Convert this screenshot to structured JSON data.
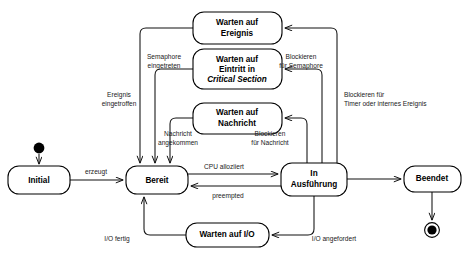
{
  "diagram": {
    "type": "uml-state-diagram",
    "language": "de",
    "colors": {
      "background": "#ffffff",
      "stroke": "#000000",
      "label": "#1a1a1a"
    },
    "states": [
      {
        "id": "initial",
        "lines": [
          "Initial"
        ],
        "x": 8,
        "y": 166,
        "w": 62,
        "h": 28
      },
      {
        "id": "bereit",
        "lines": [
          "Bereit"
        ],
        "x": 126,
        "y": 166,
        "w": 62,
        "h": 28
      },
      {
        "id": "in-ausfuehrung",
        "lines": [
          "In",
          "Ausführung"
        ],
        "x": 281,
        "y": 163,
        "w": 66,
        "h": 33
      },
      {
        "id": "beendet",
        "lines": [
          "Beendet"
        ],
        "x": 404,
        "y": 166,
        "w": 57,
        "h": 26
      },
      {
        "id": "warten-auf-ereignis",
        "lines": [
          "Warten auf",
          "Ereignis"
        ],
        "x": 193,
        "y": 12,
        "w": 89,
        "h": 32
      },
      {
        "id": "warten-auf-eintritt-critical-section",
        "lines": [
          "Warten auf",
          "Eintritt in",
          "Critical Section"
        ],
        "italic_lines": [
          2
        ],
        "x": 193,
        "y": 49,
        "w": 89,
        "h": 40
      },
      {
        "id": "warten-auf-nachricht",
        "lines": [
          "Warten auf",
          "Nachricht"
        ],
        "x": 193,
        "y": 103,
        "w": 89,
        "h": 31
      },
      {
        "id": "warten-auf-io",
        "lines": [
          "Warten auf I/O"
        ],
        "x": 186,
        "y": 223,
        "w": 83,
        "h": 24
      }
    ],
    "pseudostates": [
      {
        "id": "start-node",
        "kind": "initial-pseudostate",
        "cx": 39,
        "cy": 148,
        "r": 5.4
      },
      {
        "id": "final-node",
        "kind": "final-pseudostate",
        "cx": 432,
        "cy": 230,
        "r_outer": 7.4,
        "r_inner": 4.6
      }
    ],
    "transitions": [
      {
        "id": "t-start-initial",
        "from": "start-node",
        "to": "initial",
        "label": ""
      },
      {
        "id": "t-initial-bereit",
        "from": "initial",
        "to": "bereit",
        "label": "erzeugt",
        "label_lines": [
          "erzeugt"
        ]
      },
      {
        "id": "t-bereit-ausfuehrung",
        "from": "bereit",
        "to": "in-ausfuehrung",
        "label": "CPU alloziiert",
        "label_lines": [
          "CPU alloziiert"
        ]
      },
      {
        "id": "t-ausfuehrung-bereit",
        "from": "in-ausfuehrung",
        "to": "bereit",
        "label": "preempted",
        "label_lines": [
          "preempted"
        ]
      },
      {
        "id": "t-ausfuehrung-beendet",
        "from": "in-ausfuehrung",
        "to": "beendet",
        "label": ""
      },
      {
        "id": "t-beendet-final",
        "from": "beendet",
        "to": "final-node",
        "label": ""
      },
      {
        "id": "t-ausfuehrung-ereignis",
        "from": "in-ausfuehrung",
        "to": "warten-auf-ereignis",
        "label": "Blockieren für Timer oder internes Ereignis",
        "label_lines": [
          "Blockieren für",
          "Timer oder internes Ereignis"
        ]
      },
      {
        "id": "t-ereignis-bereit",
        "from": "warten-auf-ereignis",
        "to": "bereit",
        "label": "Ereignis eingetroffen",
        "label_lines": [
          "Ereignis",
          "eingetroffen"
        ]
      },
      {
        "id": "t-ausfuehrung-semaphore",
        "from": "in-ausfuehrung",
        "to": "warten-auf-eintritt-critical-section",
        "label": "Blockieren für Semaphore",
        "label_lines": [
          "Blockieren",
          "für Semaphore"
        ]
      },
      {
        "id": "t-semaphore-bereit",
        "from": "warten-auf-eintritt-critical-section",
        "to": "bereit",
        "label": "Semaphore eingetreten",
        "label_lines": [
          "Semaphore",
          "eingetreten"
        ]
      },
      {
        "id": "t-ausfuehrung-nachricht",
        "from": "in-ausfuehrung",
        "to": "warten-auf-nachricht",
        "label": "Blockieren für Nachricht",
        "label_lines": [
          "Blockieren",
          "für Nachricht"
        ]
      },
      {
        "id": "t-nachricht-bereit",
        "from": "warten-auf-nachricht",
        "to": "bereit",
        "label": "Nachricht angekommen",
        "label_lines": [
          "Nachricht",
          "angekommen"
        ]
      },
      {
        "id": "t-ausfuehrung-io",
        "from": "in-ausfuehrung",
        "to": "warten-auf-io",
        "label": "I/O angefordert",
        "label_lines": [
          "I/O angefordert"
        ]
      },
      {
        "id": "t-io-bereit",
        "from": "warten-auf-io",
        "to": "bereit",
        "label": "I/O fertig",
        "label_lines": [
          "I/O fertig"
        ]
      }
    ],
    "labels": {
      "erzeugt": "erzeugt",
      "cpu_alloziiert": "CPU alloziiert",
      "preempted": "preempted",
      "ereignis_l1": "Ereignis",
      "ereignis_l2": "eingetroffen",
      "semaphore_l1": "Semaphore",
      "semaphore_l2": "eingetreten",
      "nachricht_l1": "Nachricht",
      "nachricht_l2": "angekommen",
      "blk_semaphore_l1": "Blockieren",
      "blk_semaphore_l2": "für Semaphore",
      "blk_nachricht_l1": "Blockieren",
      "blk_nachricht_l2": "für Nachricht",
      "blk_timer_l1": "Blockieren für",
      "blk_timer_l2": "Timer oder internes Ereignis",
      "io_fertig": "I/O fertig",
      "io_angefordert": "I/O angefordert"
    },
    "node_text": {
      "initial": "Initial",
      "bereit": "Bereit",
      "ausfuehrung_l1": "In",
      "ausfuehrung_l2": "Ausführung",
      "beendet": "Beendet",
      "ereignis_l1": "Warten auf",
      "ereignis_l2": "Ereignis",
      "critical_l1": "Warten auf",
      "critical_l2": "Eintritt in",
      "critical_l3": "Critical Section",
      "nachricht_l1": "Warten auf",
      "nachricht_l2": "Nachricht",
      "io": "Warten auf I/O"
    }
  }
}
